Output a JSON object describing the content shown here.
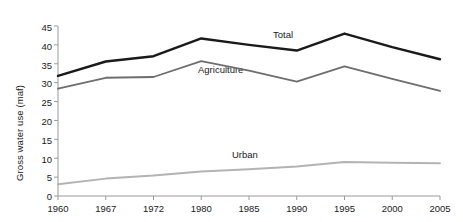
{
  "chart_data": {
    "type": "line",
    "title": "",
    "xlabel": "",
    "ylabel": "Gross water use (maf)",
    "categories": [
      "1960",
      "1967",
      "1972",
      "1980",
      "1985",
      "1990",
      "1995",
      "2000",
      "2005"
    ],
    "ylim": [
      0,
      45
    ],
    "ytick_values": [
      "0",
      "5",
      "10",
      "15",
      "20",
      "25",
      "30",
      "35",
      "40",
      "45"
    ],
    "grid": false,
    "legend_position": "inline-labels",
    "series": [
      {
        "name": "Total",
        "color": "#1a1a1a",
        "values": [
          31.8,
          35.6,
          37.0,
          41.7,
          40.0,
          38.5,
          43.0,
          39.4,
          36.2
        ]
      },
      {
        "name": "Agriculture",
        "color": "#6e6e6e",
        "values": [
          28.4,
          31.3,
          31.5,
          35.7,
          33.2,
          30.3,
          34.3,
          31.0,
          27.8
        ]
      },
      {
        "name": "Urban",
        "color": "#b3b3b3",
        "values": [
          3.1,
          4.6,
          5.4,
          6.5,
          7.1,
          7.8,
          9.0,
          8.8,
          8.7
        ]
      }
    ]
  },
  "axis": {
    "yticks": [
      "45",
      "40",
      "35",
      "30",
      "25",
      "20",
      "15",
      "10",
      "5",
      "0"
    ],
    "xticks": [
      "1960",
      "1967",
      "1972",
      "1980",
      "1985",
      "1990",
      "1995",
      "2000",
      "2005"
    ],
    "ylabel": "Gross water use (maf)"
  },
  "series_labels": {
    "total": "Total",
    "agriculture": "Agriculture",
    "urban": "Urban"
  },
  "colors": {
    "total": "#1a1a1a",
    "agriculture": "#6e6e6e",
    "urban": "#b3b3b3",
    "axis": "#9a9a9a",
    "text": "#1a1a1a"
  }
}
